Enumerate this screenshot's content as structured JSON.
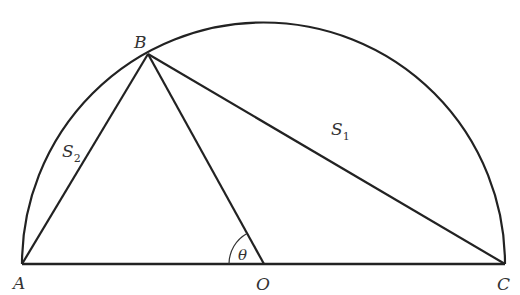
{
  "diagram": {
    "type": "semicircle-geometry",
    "stroke_color": "#222222",
    "points": {
      "A": {
        "label": "A",
        "x": 22,
        "y": 264
      },
      "B": {
        "label": "B",
        "x": 148,
        "y": 54
      },
      "O": {
        "label": "O",
        "x": 264,
        "y": 264
      },
      "C": {
        "label": "C",
        "x": 505,
        "y": 264
      }
    },
    "regions": {
      "S1": {
        "letter": "S",
        "subscript": "1"
      },
      "S2": {
        "letter": "S",
        "subscript": "2"
      }
    },
    "angle": {
      "label": "θ",
      "vertex": "O"
    },
    "segments": [
      "AC",
      "AB",
      "BO",
      "BC"
    ]
  }
}
